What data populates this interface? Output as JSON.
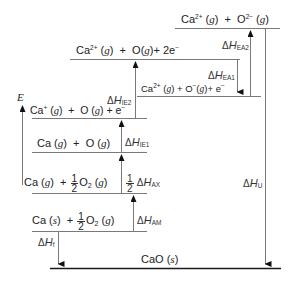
{
  "diagram": {
    "type": "born-haber-cycle",
    "compound": "CaO",
    "axis": {
      "label": "E"
    },
    "levels": [
      {
        "id": "ca2-o2m",
        "species": "Ca",
        "charge": "2+",
        "phase1": "g",
        "plus": "+",
        "species2": "O",
        "charge2": "2−",
        "phase2": "g"
      },
      {
        "id": "ca2-o-2e",
        "species": "Ca",
        "charge": "2+",
        "phase1": "g",
        "plus": "+",
        "species2": "O",
        "phase2": "g",
        "plus2": "+",
        "electrons": "2e",
        "echarge": "−"
      },
      {
        "id": "ca2-om-e",
        "species": "Ca",
        "charge": "2+",
        "phase1": "g",
        "plus": "+",
        "species2": "O",
        "charge2": "−",
        "phase2": "g",
        "plus2": "+",
        "electrons": "e",
        "echarge": "−"
      },
      {
        "id": "ca1-o-e",
        "species": "Ca",
        "charge": "+",
        "phase1": "g",
        "plus": "+",
        "species2": "O",
        "phase2": "g",
        "plus2": "+",
        "electrons": "e",
        "echarge": "−"
      },
      {
        "id": "ca-o",
        "species": "Ca",
        "phase1": "g",
        "plus": "+",
        "species2": "O",
        "phase2": "g"
      },
      {
        "id": "ca-half-o2",
        "species": "Ca",
        "phase1": "g",
        "plus": "+",
        "frac_num": "1",
        "frac_den": "2",
        "species2": "O",
        "sub2": "2",
        "phase2": "g"
      },
      {
        "id": "cas-half-o2",
        "species": "Ca",
        "phase1": "s",
        "plus": "+",
        "frac_num": "1",
        "frac_den": "2",
        "species2": "O",
        "sub2": "2",
        "phase2": "g"
      },
      {
        "id": "cao-s",
        "species": "CaO",
        "phase1": "s"
      }
    ],
    "arrows": [
      {
        "id": "ea2",
        "delta": "Δ",
        "symbol": "H",
        "sub": "EA2",
        "direction": "up"
      },
      {
        "id": "ea1",
        "delta": "Δ",
        "symbol": "H",
        "sub": "EA1",
        "direction": "down"
      },
      {
        "id": "ie2",
        "delta": "Δ",
        "symbol": "H",
        "sub": "IE2",
        "direction": "up"
      },
      {
        "id": "ie1",
        "delta": "Δ",
        "symbol": "H",
        "sub": "IE1",
        "direction": "up"
      },
      {
        "id": "ax",
        "coef_num": "1",
        "coef_den": "2",
        "delta": "Δ",
        "symbol": "H",
        "sub": "AX",
        "direction": "up"
      },
      {
        "id": "am",
        "delta": "Δ",
        "symbol": "H",
        "sub": "AM",
        "direction": "up"
      },
      {
        "id": "f",
        "delta": "Δ",
        "symbol": "H",
        "sub": "f",
        "direction": "down"
      },
      {
        "id": "u",
        "delta": "Δ",
        "symbol": "H",
        "sub": "U",
        "direction": "down"
      }
    ],
    "colors": {
      "line": "#7a7a7a",
      "baseline": "#1a1a1a",
      "text": "#222222"
    }
  }
}
